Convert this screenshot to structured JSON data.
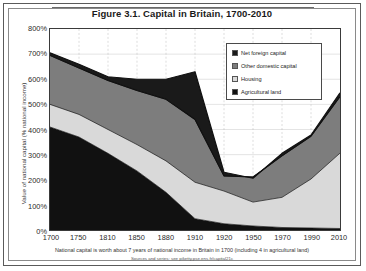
{
  "figure": {
    "title": "Figure 3.1. Capital in Britain, 1700-2010",
    "caption": "National capital is worth about 7 years of national income in Britain in 1700 (including 4 in agricultural land)",
    "source": "Sources and series: see piketty.pse.ens.fr/capital21c"
  },
  "legend": {
    "position": "inside-top-right",
    "items": [
      {
        "label": "Net foreign capital",
        "color": "#1a1a1a"
      },
      {
        "label": "Other domestic capital",
        "color": "#7d7d7d"
      },
      {
        "label": "Housing",
        "color": "#d9d9d9"
      },
      {
        "label": "Agricultural land",
        "color": "#111111"
      }
    ]
  },
  "axes": {
    "ylabel": "Value of national capital (% national income)",
    "xlabel": "",
    "yticks": [
      "0%",
      "100%",
      "200%",
      "300%",
      "400%",
      "500%",
      "600%",
      "700%",
      "800%"
    ],
    "xticks": [
      "1700",
      "1750",
      "1810",
      "1850",
      "1880",
      "1910",
      "1920",
      "1950",
      "1970",
      "1990",
      "2010"
    ]
  },
  "chart_data": {
    "type": "area",
    "title": "Figure 3.1. Capital in Britain, 1700-2010",
    "xlabel": "",
    "ylabel": "Value of national capital (% national income)",
    "ylim": [
      0,
      800
    ],
    "ytick_step": 100,
    "grid": true,
    "stacked": true,
    "legend_position": "inside-top-right",
    "x": [
      1700,
      1750,
      1810,
      1850,
      1880,
      1910,
      1920,
      1950,
      1970,
      1990,
      2010
    ],
    "series": [
      {
        "name": "Agricultural land",
        "color": "#111111",
        "values": [
          410,
          370,
          305,
          235,
          150,
          45,
          25,
          16,
          10,
          8,
          6
        ]
      },
      {
        "name": "Housing",
        "color": "#d9d9d9",
        "values": [
          90,
          90,
          95,
          105,
          125,
          145,
          130,
          95,
          120,
          195,
          300
        ]
      },
      {
        "name": "Other domestic capital",
        "color": "#7d7d7d",
        "values": [
          195,
          185,
          195,
          215,
          245,
          250,
          60,
          100,
          165,
          170,
          225
        ]
      },
      {
        "name": "Net foreign capital",
        "color": "#1a1a1a",
        "values": [
          10,
          15,
          15,
          45,
          80,
          190,
          15,
          -5,
          10,
          5,
          15
        ]
      }
    ],
    "totals": [
      705,
      660,
      610,
      600,
      600,
      630,
      230,
      206,
      305,
      378,
      546
    ],
    "annotation": "National capital is worth about 7 years of national income in Britain in 1700 (including 4 in agricultural land)"
  }
}
